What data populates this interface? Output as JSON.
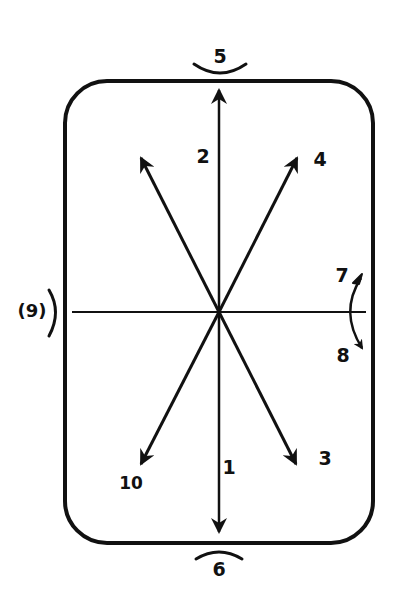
{
  "diagram": {
    "type": "direction-diagram",
    "stroke_color": "#111111",
    "background": "#ffffff",
    "frame": {
      "x": 65,
      "y": 81,
      "width": 308,
      "height": 462,
      "corner_radius": 42
    },
    "center": {
      "x": 219,
      "y": 312
    },
    "labels": {
      "l1": "1",
      "l2": "2",
      "l3": "3",
      "l4": "4",
      "l5": "5",
      "l6": "6",
      "l7": "7",
      "l8": "8",
      "l9": "(9)",
      "l10": "10"
    },
    "arrows": [
      {
        "label": "1",
        "direction": "down",
        "tip": [
          219,
          533
        ]
      },
      {
        "label": "2",
        "direction": "up",
        "tip": [
          219,
          89
        ]
      },
      {
        "label": "3",
        "direction": "down-right",
        "tip": [
          296,
          465
        ]
      },
      {
        "label": "4",
        "direction": "up-right",
        "tip": [
          297,
          157
        ]
      },
      {
        "label": "10",
        "direction": "down-left",
        "tip": [
          141,
          465
        ]
      },
      {
        "label": "",
        "direction": "up-left",
        "tip": [
          141,
          157
        ]
      }
    ],
    "rotations": [
      {
        "label": "5",
        "position": "top",
        "type": "arc"
      },
      {
        "label": "6",
        "position": "bottom",
        "type": "arc"
      },
      {
        "label": "7",
        "position": "right-upper",
        "type": "curved-arrow"
      },
      {
        "label": "8",
        "position": "right-lower",
        "type": "curved-arrow"
      },
      {
        "label": "9",
        "position": "left",
        "type": "arc"
      }
    ]
  }
}
